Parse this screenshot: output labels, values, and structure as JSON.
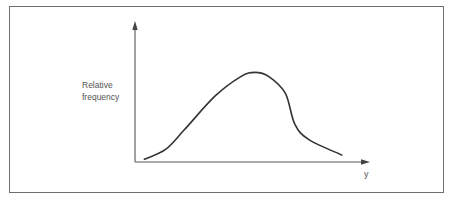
{
  "chart_data": {
    "type": "line",
    "title": "",
    "xlabel": "y",
    "ylabel_lines": [
      "Relative",
      "frequency"
    ],
    "grid": false,
    "legend": "none",
    "xlim": [
      0,
      1
    ],
    "ylim": [
      0,
      1
    ],
    "x_ticks": [],
    "y_ticks": [],
    "series": [
      {
        "name": "relative-frequency-curve",
        "x": [
          0.04,
          0.13,
          0.21,
          0.34,
          0.45,
          0.51,
          0.57,
          0.64,
          0.68,
          0.74,
          0.88
        ],
        "y": [
          0.02,
          0.09,
          0.23,
          0.47,
          0.61,
          0.64,
          0.61,
          0.49,
          0.27,
          0.16,
          0.05
        ]
      }
    ],
    "colors": {
      "line": "#333333",
      "axes": "#555555",
      "frame": "#6e6e6e"
    }
  }
}
